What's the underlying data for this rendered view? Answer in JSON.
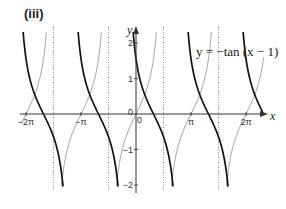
{
  "panel_label": "(iii)",
  "equation_label": "y = −tan (x − 1)",
  "axis": {
    "x_label": "x",
    "y_label": "y",
    "x_ticks": [
      {
        "value": -6.283185,
        "label": "−2π"
      },
      {
        "value": -3.141593,
        "label": "−π"
      },
      {
        "value": 0,
        "label": "0"
      },
      {
        "value": 3.141593,
        "label": "π"
      },
      {
        "value": 6.283185,
        "label": "2π"
      }
    ],
    "y_ticks": [
      {
        "value": 2,
        "label": "2"
      },
      {
        "value": 1,
        "label": "1"
      },
      {
        "value": -1,
        "label": "−1"
      },
      {
        "value": -2,
        "label": "−2"
      }
    ],
    "origin_label": "0"
  },
  "colors": {
    "primary_curve": "#111111",
    "reference_curve": "#b0b0b0",
    "axis": "#333333",
    "asymptote": "#888888"
  },
  "chart_data": {
    "type": "line",
    "title": "(iii)",
    "xlabel": "x",
    "ylabel": "y",
    "xlim": [
      -6.6,
      7.4
    ],
    "ylim": [
      -2.2,
      2.4
    ],
    "grid": false,
    "legend": null,
    "annotations": [
      "y = −tan (x − 1)"
    ],
    "series": [
      {
        "name": "y = −tan(x − 1)",
        "style": "solid black, thick",
        "function": "-tan(x-1)",
        "zeros": [
          -5.283,
          -2.142,
          1.0,
          4.142,
          7.283
        ]
      },
      {
        "name": "y = tan x",
        "style": "solid grey, thin",
        "function": "tan(x)",
        "zeros": [
          -6.283,
          -3.142,
          0,
          3.142,
          6.283
        ]
      }
    ],
    "asymptotes_dotted_x": [
      -4.712389,
      -1.570796,
      1.570796,
      4.712389
    ]
  }
}
